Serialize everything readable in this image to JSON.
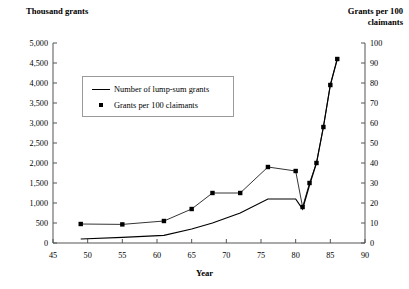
{
  "titles": {
    "left_axis": "Thousand grants",
    "right_axis": "Grants per 100 claimants",
    "right_axis_line1": "Grants per 100",
    "right_axis_line2": "claimants",
    "x_axis": "Year"
  },
  "legend": {
    "items": [
      {
        "label": "Number of lump-sum grants",
        "key": "line",
        "color": "#000000"
      },
      {
        "label": "Grants per 100 claimants",
        "key": "marker",
        "color": "#000000"
      }
    ]
  },
  "axes": {
    "left_ticks": [
      "0",
      "500",
      "1,000",
      "1,500",
      "2,000",
      "2,500",
      "3,000",
      "3,500",
      "4,000",
      "4,500",
      "5,000"
    ],
    "right_ticks": [
      "0",
      "10",
      "20",
      "30",
      "40",
      "50",
      "60",
      "70",
      "80",
      "90",
      "100"
    ],
    "x_ticks": [
      "45",
      "50",
      "55",
      "60",
      "65",
      "70",
      "75",
      "80",
      "85",
      "90"
    ]
  },
  "chart_data": {
    "type": "line",
    "title": "",
    "xlabel": "Year",
    "ylabel": "Thousand grants",
    "y2label": "Grants per 100 claimants",
    "xlim": [
      45,
      90
    ],
    "ylim": [
      0,
      5000
    ],
    "y2lim": [
      0,
      100
    ],
    "xticks": [
      45,
      50,
      55,
      60,
      65,
      70,
      75,
      80,
      85,
      90
    ],
    "yticks": [
      0,
      500,
      1000,
      1500,
      2000,
      2500,
      3000,
      3500,
      4000,
      4500,
      5000
    ],
    "y2ticks": [
      0,
      10,
      20,
      30,
      40,
      50,
      60,
      70,
      80,
      90,
      100
    ],
    "grid": false,
    "legend_position": "upper-left-inside",
    "series": [
      {
        "name": "Number of lump-sum grants",
        "axis": "left",
        "style": "solid-line",
        "marker": "none",
        "x": [
          49,
          55,
          61,
          65,
          68,
          72,
          76,
          80,
          81,
          82,
          83,
          84,
          85,
          86
        ],
        "values": [
          100,
          140,
          190,
          350,
          500,
          750,
          1100,
          1100,
          850,
          1450,
          2000,
          2900,
          3950,
          4600
        ]
      },
      {
        "name": "Grants per 100 claimants",
        "axis": "right",
        "style": "thin-line",
        "marker": "square",
        "x": [
          49,
          55,
          61,
          65,
          68,
          72,
          76,
          80,
          81,
          82,
          83,
          84,
          85,
          86
        ],
        "values": [
          9.5,
          9.3,
          11,
          17,
          25,
          25,
          38,
          36,
          18,
          30,
          40,
          58,
          79,
          92
        ]
      }
    ]
  }
}
